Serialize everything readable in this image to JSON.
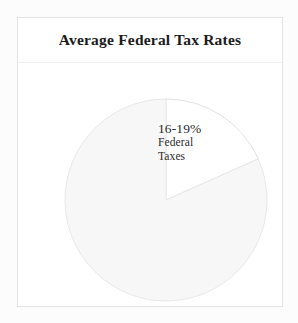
{
  "card": {
    "title": "Average Federal Tax Rates"
  },
  "chart_data": {
    "type": "pie",
    "title": "Average Federal Tax Rates",
    "xlabel": "",
    "ylabel": "",
    "legend": "none",
    "grid": false,
    "start_angle_deg": 0,
    "direction": "clockwise",
    "categories": [
      "Federal Taxes",
      "Remainder"
    ],
    "values": [
      18,
      82
    ],
    "slices": [
      {
        "label": "Federal Taxes",
        "value_label": "16-19%",
        "name_line_1": "Federal",
        "name_line_2": "Taxes",
        "value": 18,
        "start_angle_deg": 0,
        "end_angle_deg": 66,
        "fill": "#ffffff",
        "stroke": "#e2e2e2",
        "highlighted": true
      },
      {
        "label": "Remainder",
        "value_label": "",
        "value": 82,
        "start_angle_deg": 66,
        "end_angle_deg": 360,
        "fill": "#f7f7f7",
        "stroke": "#e8e8e8",
        "highlighted": false
      }
    ],
    "annotations": [
      {
        "text": "16-19% Federal Taxes",
        "target_slice": "Federal Taxes",
        "placement": "inside-slice"
      }
    ]
  },
  "colors": {
    "page_background": "#fcfcfc",
    "card_background": "#ffffff",
    "card_border": "#e4e4e4",
    "header_divider": "#f0f0f0",
    "title_text": "#1b1b1b",
    "label_text": "#2a2a2a",
    "slice_highlight_fill": "#ffffff",
    "slice_muted_fill": "#f7f7f7",
    "slice_stroke": "#e8e8e8"
  },
  "geometry": {
    "center_x": 148,
    "center_y": 136,
    "radius": 101
  }
}
